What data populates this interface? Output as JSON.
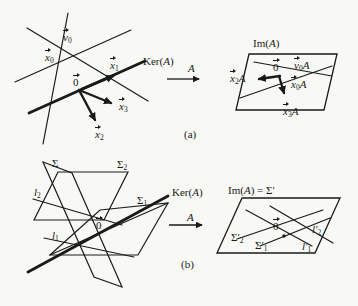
{
  "figure": {
    "ink_color": "#1a1a1a",
    "paper_color": "#f8f8f5",
    "labels": [
      {
        "id": "v0",
        "panel": "a-domain",
        "x": 63,
        "y": 32,
        "vec": true,
        "segs": [
          {
            "t": "v",
            "i": true
          },
          {
            "t": "0",
            "sub": true
          }
        ]
      },
      {
        "id": "x0",
        "panel": "a-domain",
        "x": 45,
        "y": 52,
        "vec": true,
        "segs": [
          {
            "t": "x",
            "i": true
          },
          {
            "t": "0",
            "sub": true
          }
        ]
      },
      {
        "id": "x1",
        "panel": "a-domain",
        "x": 110,
        "y": 60,
        "vec": true,
        "segs": [
          {
            "t": "x",
            "i": true
          },
          {
            "t": "1",
            "sub": true
          }
        ]
      },
      {
        "id": "ker-a",
        "panel": "a-domain",
        "x": 143,
        "y": 56,
        "vec": false,
        "segs": [
          {
            "t": "Ker("
          },
          {
            "t": "A",
            "i": true
          },
          {
            "t": ")"
          }
        ]
      },
      {
        "id": "zero-a-domain",
        "panel": "a-domain",
        "x": 73,
        "y": 77,
        "vec": true,
        "segs": [
          {
            "t": "0"
          }
        ]
      },
      {
        "id": "x3",
        "panel": "a-domain",
        "x": 119,
        "y": 101,
        "vec": true,
        "segs": [
          {
            "t": "x",
            "i": true
          },
          {
            "t": "3",
            "sub": true
          }
        ]
      },
      {
        "id": "x2",
        "panel": "a-domain",
        "x": 95,
        "y": 129,
        "vec": true,
        "segs": [
          {
            "t": "x",
            "i": true
          },
          {
            "t": "2",
            "sub": true
          }
        ]
      },
      {
        "id": "map-a",
        "panel": "a-map",
        "x": 188,
        "y": 63,
        "vec": false,
        "segs": [
          {
            "t": "A",
            "i": true
          }
        ]
      },
      {
        "id": "caption-a",
        "panel": "a",
        "x": 184,
        "y": 129,
        "vec": false,
        "segs": [
          {
            "t": "(a)"
          }
        ]
      },
      {
        "id": "im-a-title",
        "panel": "a-image",
        "x": 253,
        "y": 38,
        "vec": false,
        "segs": [
          {
            "t": "Im("
          },
          {
            "t": "A",
            "i": true
          },
          {
            "t": ")"
          }
        ]
      },
      {
        "id": "v0A",
        "panel": "a-image",
        "x": 294,
        "y": 60,
        "vec": true,
        "segs": [
          {
            "t": "v",
            "i": true
          },
          {
            "t": "0",
            "sub": true
          },
          {
            "t": "A",
            "i": true
          }
        ]
      },
      {
        "id": "zero-a-image",
        "panel": "a-image",
        "x": 273,
        "y": 62,
        "vec": true,
        "segs": [
          {
            "t": "0"
          }
        ]
      },
      {
        "id": "x2A",
        "panel": "a-image",
        "x": 230,
        "y": 73,
        "vec": true,
        "segs": [
          {
            "t": "x",
            "i": true
          },
          {
            "t": "2",
            "sub": true
          },
          {
            "t": "A",
            "i": true
          }
        ]
      },
      {
        "id": "x0A",
        "panel": "a-image",
        "x": 291,
        "y": 79,
        "vec": true,
        "segs": [
          {
            "t": "x",
            "i": true
          },
          {
            "t": "0",
            "sub": true
          },
          {
            "t": "A",
            "i": true
          }
        ]
      },
      {
        "id": "x3A",
        "panel": "a-image",
        "x": 283,
        "y": 106,
        "vec": true,
        "segs": [
          {
            "t": "x",
            "i": true
          },
          {
            "t": "3",
            "sub": true
          },
          {
            "t": "A",
            "i": true
          }
        ]
      },
      {
        "id": "sigma",
        "panel": "b-domain",
        "x": 52,
        "y": 158,
        "vec": false,
        "segs": [
          {
            "t": "Σ"
          }
        ]
      },
      {
        "id": "sigma2",
        "panel": "b-domain",
        "x": 117,
        "y": 159,
        "vec": false,
        "segs": [
          {
            "t": "Σ"
          },
          {
            "t": "2",
            "sub": true
          }
        ]
      },
      {
        "id": "l2",
        "panel": "b-domain",
        "x": 34,
        "y": 187,
        "vec": false,
        "segs": [
          {
            "t": "l",
            "i": true
          },
          {
            "t": "2",
            "sub": true
          }
        ]
      },
      {
        "id": "sigma1",
        "panel": "b-domain",
        "x": 137,
        "y": 195,
        "vec": false,
        "segs": [
          {
            "t": "Σ"
          },
          {
            "t": "1",
            "sub": true
          }
        ]
      },
      {
        "id": "ker-a-b",
        "panel": "b-domain",
        "x": 172,
        "y": 187,
        "vec": false,
        "segs": [
          {
            "t": "Ker("
          },
          {
            "t": "A",
            "i": true
          },
          {
            "t": ")"
          }
        ]
      },
      {
        "id": "zero-b-domain",
        "panel": "b-domain",
        "x": 96,
        "y": 220,
        "vec": true,
        "segs": [
          {
            "t": "0"
          }
        ]
      },
      {
        "id": "l1",
        "panel": "b-domain",
        "x": 52,
        "y": 230,
        "vec": false,
        "segs": [
          {
            "t": "l",
            "i": true
          },
          {
            "t": "1",
            "sub": true
          }
        ]
      },
      {
        "id": "map-a-b",
        "panel": "b-map",
        "x": 187,
        "y": 212,
        "vec": false,
        "segs": [
          {
            "t": "A",
            "i": true
          }
        ]
      },
      {
        "id": "caption-b",
        "panel": "b",
        "x": 181,
        "y": 259,
        "vec": false,
        "segs": [
          {
            "t": "(b)"
          }
        ]
      },
      {
        "id": "im-a-sigma-title",
        "panel": "b-image",
        "x": 228,
        "y": 185,
        "vec": false,
        "segs": [
          {
            "t": "Im("
          },
          {
            "t": "A",
            "i": true
          },
          {
            "t": ") = Σ′"
          }
        ]
      },
      {
        "id": "sigma2-prime",
        "panel": "b-image",
        "x": 231,
        "y": 232,
        "vec": false,
        "segs": [
          {
            "t": "Σ′"
          },
          {
            "t": "2",
            "sub": true
          }
        ]
      },
      {
        "id": "sigma1-prime",
        "panel": "b-image",
        "x": 255,
        "y": 240,
        "vec": false,
        "segs": [
          {
            "t": "Σ′"
          },
          {
            "t": "1",
            "sub": true
          }
        ]
      },
      {
        "id": "zero-b-image",
        "panel": "b-image",
        "x": 273,
        "y": 221,
        "vec": true,
        "segs": [
          {
            "t": "0"
          }
        ]
      },
      {
        "id": "l2-prime",
        "panel": "b-image",
        "x": 312,
        "y": 224,
        "vec": false,
        "segs": [
          {
            "t": "l′",
            "i": true
          },
          {
            "t": "2",
            "sub": true
          }
        ]
      },
      {
        "id": "l1-prime",
        "panel": "b-image",
        "x": 302,
        "y": 241,
        "vec": false,
        "segs": [
          {
            "t": "l′",
            "i": true
          },
          {
            "t": "1",
            "sub": true
          }
        ]
      }
    ]
  }
}
